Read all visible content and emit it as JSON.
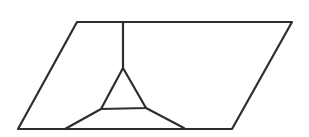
{
  "figure": {
    "type": "geometric-diagram",
    "canvas": {
      "width": 309,
      "height": 137,
      "background": "#ffffff"
    },
    "stroke": {
      "color": "#2e2e2e",
      "width": 2.2
    },
    "shapes": [
      {
        "name": "parallelogram-outline",
        "kind": "polygon",
        "points": [
          [
            77,
            22
          ],
          [
            292,
            22
          ],
          [
            232,
            129
          ],
          [
            18,
            129
          ]
        ]
      },
      {
        "name": "vertical-segment",
        "kind": "polyline",
        "points": [
          [
            123,
            22
          ],
          [
            123,
            68
          ]
        ]
      },
      {
        "name": "inner-triangle",
        "kind": "polygon",
        "points": [
          [
            123,
            68
          ],
          [
            146,
            108
          ],
          [
            101,
            109
          ]
        ]
      },
      {
        "name": "left-leg-segment",
        "kind": "polyline",
        "points": [
          [
            101,
            109
          ],
          [
            65,
            129
          ]
        ]
      },
      {
        "name": "right-leg-segment",
        "kind": "polyline",
        "points": [
          [
            146,
            108
          ],
          [
            184,
            128
          ]
        ]
      }
    ]
  }
}
